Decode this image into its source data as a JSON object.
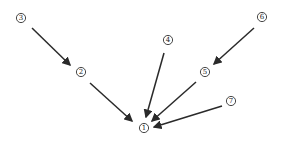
{
  "diagram": {
    "type": "directed-graph",
    "nodes": [
      {
        "id": "n1",
        "label": "1",
        "x": 144,
        "y": 128
      },
      {
        "id": "n2",
        "label": "2",
        "x": 81,
        "y": 72
      },
      {
        "id": "n3",
        "label": "3",
        "x": 21,
        "y": 18
      },
      {
        "id": "n4",
        "label": "4",
        "x": 168,
        "y": 40
      },
      {
        "id": "n5",
        "label": "5",
        "x": 205,
        "y": 72
      },
      {
        "id": "n6",
        "label": "6",
        "x": 262,
        "y": 17
      },
      {
        "id": "n7",
        "label": "7",
        "x": 231,
        "y": 101
      }
    ],
    "edges": [
      {
        "from": "3",
        "to": "2",
        "x1": 32,
        "y1": 28,
        "x2": 70,
        "y2": 65
      },
      {
        "from": "2",
        "to": "1",
        "x1": 90,
        "y1": 83,
        "x2": 132,
        "y2": 121
      },
      {
        "from": "4",
        "to": "1",
        "x1": 164,
        "y1": 53,
        "x2": 146,
        "y2": 117
      },
      {
        "from": "6",
        "to": "5",
        "x1": 254,
        "y1": 28,
        "x2": 214,
        "y2": 64
      },
      {
        "from": "5",
        "to": "1",
        "x1": 196,
        "y1": 82,
        "x2": 152,
        "y2": 121
      },
      {
        "from": "7",
        "to": "1",
        "x1": 222,
        "y1": 106,
        "x2": 154,
        "y2": 127
      }
    ],
    "colors": {
      "stroke": "#2a2a2a",
      "background": "#ffffff"
    }
  }
}
